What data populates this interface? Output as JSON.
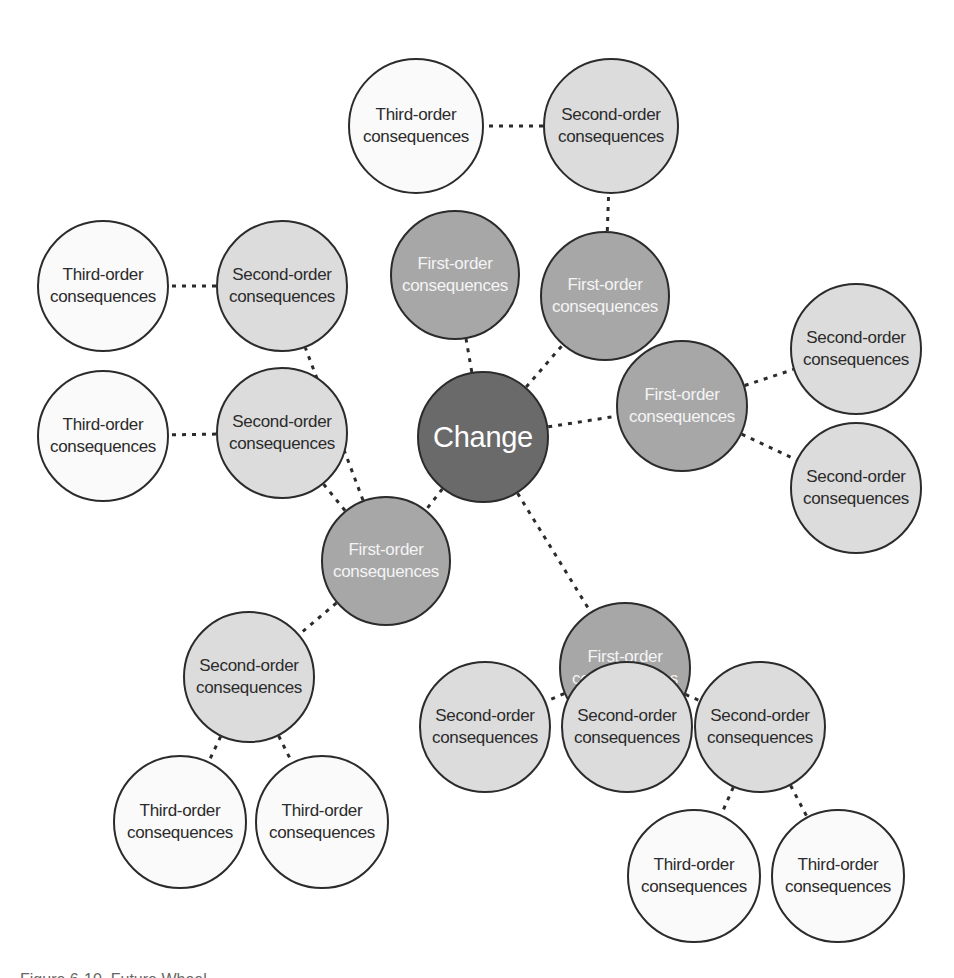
{
  "diagram": {
    "type": "future-wheel",
    "colors": {
      "change_fill": "#6a6a6a",
      "first_order_fill": "#a7a7a7",
      "second_order_fill": "#dcdcdc",
      "third_order_fill": "#fafafa",
      "stroke": "#2b2b2b"
    },
    "center": {
      "label": "Change",
      "x": 483,
      "y": 437,
      "r": 66
    },
    "nodes": [
      {
        "id": "f1",
        "level": "first",
        "line1": "First-order",
        "line2": "consequences",
        "x": 455,
        "y": 275,
        "r": 65
      },
      {
        "id": "f2",
        "level": "first",
        "line1": "First-order",
        "line2": "consequences",
        "x": 605,
        "y": 296,
        "r": 65
      },
      {
        "id": "f3",
        "level": "first",
        "line1": "First-order",
        "line2": "consequences",
        "x": 682,
        "y": 406,
        "r": 66
      },
      {
        "id": "f4",
        "level": "first",
        "line1": "First-order",
        "line2": "consequences",
        "x": 386,
        "y": 561,
        "r": 65
      },
      {
        "id": "f5",
        "level": "first",
        "line1": "First-order",
        "line2": "consequences",
        "x": 625,
        "y": 668,
        "r": 66
      },
      {
        "id": "s1",
        "level": "second",
        "line1": "Second-order",
        "line2": "consequences",
        "x": 611,
        "y": 126,
        "r": 68
      },
      {
        "id": "s2",
        "level": "second",
        "line1": "Second-order",
        "line2": "consequences",
        "x": 282,
        "y": 286,
        "r": 66
      },
      {
        "id": "s3",
        "level": "second",
        "line1": "Second-order",
        "line2": "consequences",
        "x": 282,
        "y": 433,
        "r": 66
      },
      {
        "id": "s4",
        "level": "second",
        "line1": "Second-order",
        "line2": "consequences",
        "x": 856,
        "y": 349,
        "r": 66
      },
      {
        "id": "s5",
        "level": "second",
        "line1": "Second-order",
        "line2": "consequences",
        "x": 856,
        "y": 488,
        "r": 66
      },
      {
        "id": "s6",
        "level": "second",
        "line1": "Second-order",
        "line2": "consequences",
        "x": 249,
        "y": 677,
        "r": 66
      },
      {
        "id": "s7",
        "level": "second",
        "line1": "Second-order",
        "line2": "consequences",
        "x": 485,
        "y": 727,
        "r": 66
      },
      {
        "id": "s8",
        "level": "second",
        "line1": "Second-order",
        "line2": "consequences",
        "x": 627,
        "y": 727,
        "r": 66
      },
      {
        "id": "s9",
        "level": "second",
        "line1": "Second-order",
        "line2": "consequences",
        "x": 760,
        "y": 727,
        "r": 66
      },
      {
        "id": "t1",
        "level": "third",
        "line1": "Third-order",
        "line2": "consequences",
        "x": 416,
        "y": 126,
        "r": 68
      },
      {
        "id": "t2",
        "level": "third",
        "line1": "Third-order",
        "line2": "consequences",
        "x": 103,
        "y": 286,
        "r": 66
      },
      {
        "id": "t3",
        "level": "third",
        "line1": "Third-order",
        "line2": "consequences",
        "x": 103,
        "y": 436,
        "r": 66
      },
      {
        "id": "t4",
        "level": "third",
        "line1": "Third-order",
        "line2": "consequences",
        "x": 180,
        "y": 822,
        "r": 67
      },
      {
        "id": "t5",
        "level": "third",
        "line1": "Third-order",
        "line2": "consequences",
        "x": 322,
        "y": 822,
        "r": 67
      },
      {
        "id": "t6",
        "level": "third",
        "line1": "Third-order",
        "line2": "consequences",
        "x": 694,
        "y": 876,
        "r": 67
      },
      {
        "id": "t7",
        "level": "third",
        "line1": "Third-order",
        "line2": "consequences",
        "x": 838,
        "y": 876,
        "r": 67
      }
    ],
    "links": [
      [
        "center",
        "f1"
      ],
      [
        "center",
        "f2"
      ],
      [
        "center",
        "f3"
      ],
      [
        "center",
        "f4"
      ],
      [
        "center",
        "f5"
      ],
      [
        "f2",
        "s1"
      ],
      [
        "s1",
        "t1"
      ],
      [
        "f4",
        "s2"
      ],
      [
        "s2",
        "t2"
      ],
      [
        "f4",
        "s3"
      ],
      [
        "s3",
        "t3"
      ],
      [
        "f3",
        "s4"
      ],
      [
        "f3",
        "s5"
      ],
      [
        "f4",
        "s6"
      ],
      [
        "s6",
        "t4"
      ],
      [
        "s6",
        "t5"
      ],
      [
        "f5",
        "s7"
      ],
      [
        "f5",
        "s8"
      ],
      [
        "f5",
        "s9"
      ],
      [
        "s9",
        "t6"
      ],
      [
        "s9",
        "t7"
      ]
    ]
  },
  "caption": {
    "text": "Figure 6-10. Future Wheel"
  }
}
